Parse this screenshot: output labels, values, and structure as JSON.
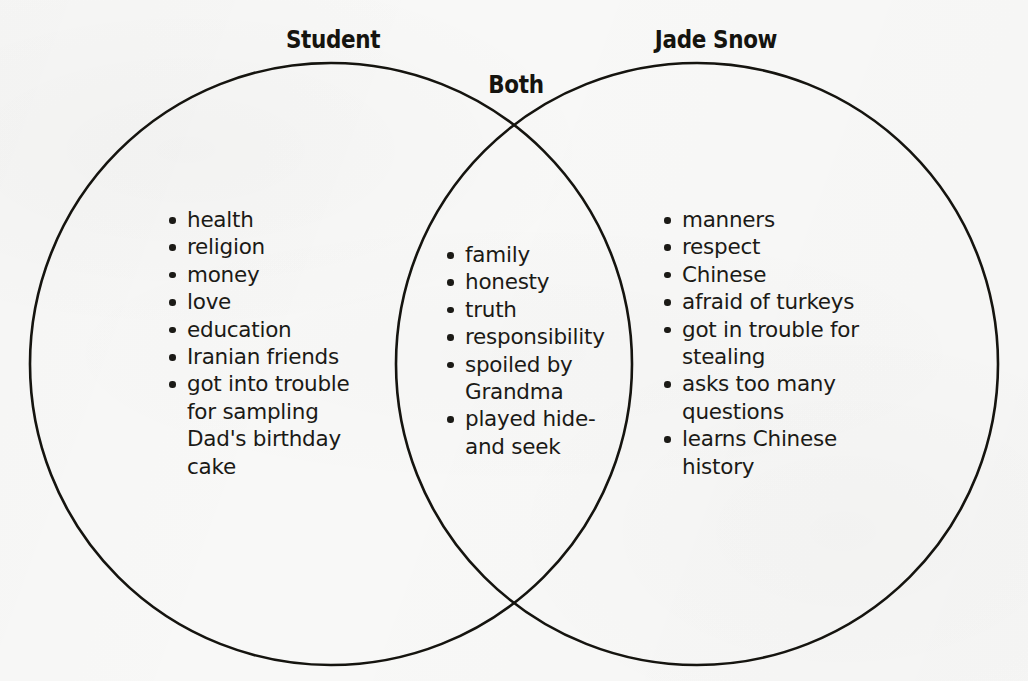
{
  "diagram": {
    "type": "venn-2-set",
    "background_color": "#f8f8f7",
    "stroke_color": "#15140f",
    "text_color": "#1b1a16",
    "headings": {
      "left": "Student",
      "overlap": "Both",
      "right": "Jade Snow"
    },
    "sets": {
      "left": {
        "label": "Student",
        "items": [
          "health",
          "religion",
          "money",
          "love",
          "education",
          "Iranian friends",
          "got into trouble for sampling Dad's birthday cake"
        ]
      },
      "overlap": {
        "label": "Both",
        "items": [
          "family",
          "honesty",
          "truth",
          "responsibility",
          "spoiled by Grandma",
          "played hide-and seek"
        ]
      },
      "right": {
        "label": "Jade Snow",
        "items": [
          "manners",
          "respect",
          "Chinese",
          "afraid of turkeys",
          "got in trouble for stealing",
          "asks too many questions",
          "learns Chinese history"
        ]
      }
    },
    "geometry": {
      "left_circle": {
        "cx": 331,
        "cy": 364,
        "r": 301
      },
      "right_circle": {
        "cx": 697,
        "cy": 364,
        "r": 301
      },
      "stroke_width": 2.6
    }
  }
}
